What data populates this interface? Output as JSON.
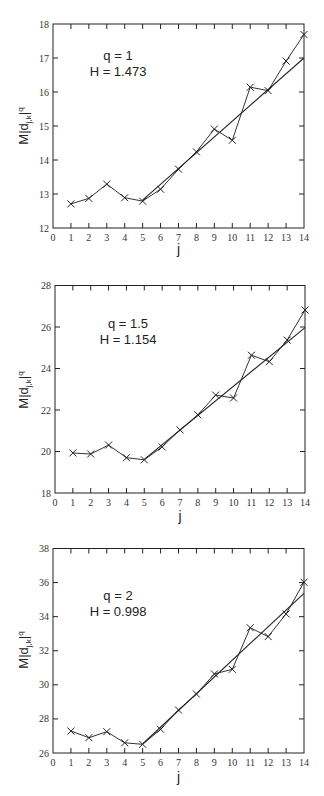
{
  "chart_data": [
    {
      "type": "line",
      "title": "",
      "annotation": [
        "q = 1",
        "H = 1.473"
      ],
      "xlabel": "j",
      "ylabel": "M|d_{j,k}|^q",
      "ylabel_parts": {
        "main": "M|d",
        "sub": "j,k",
        "tail": "|",
        "sup": "q"
      },
      "xlim": [
        0,
        14
      ],
      "ylim": [
        12,
        18
      ],
      "xticks": [
        "0",
        "1",
        "2",
        "3",
        "4",
        "5",
        "6",
        "7",
        "8",
        "9",
        "10",
        "11",
        "12",
        "13",
        "14"
      ],
      "yticks": [
        "12",
        "13",
        "14",
        "15",
        "16",
        "17",
        "18"
      ],
      "grid": false,
      "series": [
        {
          "name": "data",
          "marker": "x",
          "x": [
            1,
            2,
            3,
            4,
            5,
            6,
            7,
            8,
            9,
            10,
            11,
            12,
            13,
            14
          ],
          "y": [
            12.71,
            12.87,
            13.29,
            12.89,
            12.79,
            13.14,
            13.73,
            14.24,
            14.91,
            14.58,
            16.14,
            16.04,
            16.91,
            17.69
          ]
        },
        {
          "name": "fit",
          "marker": "none",
          "x": [
            5,
            14
          ],
          "y": [
            12.82,
            17.0
          ]
        }
      ]
    },
    {
      "type": "line",
      "title": "",
      "annotation": [
        "q = 1.5",
        "H = 1.154"
      ],
      "xlabel": "j",
      "ylabel": "M|d_{j,k}|^q",
      "ylabel_parts": {
        "main": "M|d",
        "sub": "j,k",
        "tail": "|",
        "sup": "q"
      },
      "xlim": [
        0,
        14
      ],
      "ylim": [
        18,
        28
      ],
      "xticks": [
        "0",
        "1",
        "2",
        "3",
        "4",
        "5",
        "6",
        "7",
        "8",
        "9",
        "10",
        "11",
        "12",
        "13",
        "14"
      ],
      "yticks": [
        "18",
        "20",
        "22",
        "24",
        "26",
        "28"
      ],
      "grid": false,
      "series": [
        {
          "name": "data",
          "marker": "x",
          "x": [
            1,
            2,
            3,
            4,
            5,
            6,
            7,
            8,
            9,
            10,
            11,
            12,
            13,
            14
          ],
          "y": [
            19.93,
            19.88,
            20.31,
            19.7,
            19.6,
            20.22,
            21.04,
            21.77,
            22.72,
            22.58,
            24.64,
            24.33,
            25.37,
            26.82
          ]
        },
        {
          "name": "fit",
          "marker": "none",
          "x": [
            5,
            14
          ],
          "y": [
            19.62,
            25.97
          ]
        }
      ]
    },
    {
      "type": "line",
      "title": "",
      "annotation": [
        "q = 2",
        "H = 0.998"
      ],
      "xlabel": "j",
      "ylabel": "M|d_{j,k}|^q",
      "ylabel_parts": {
        "main": "M|d",
        "sub": "j,k",
        "tail": "|",
        "sup": "q"
      },
      "xlim": [
        0,
        14
      ],
      "ylim": [
        26,
        38
      ],
      "xticks": [
        "0",
        "1",
        "2",
        "3",
        "4",
        "5",
        "6",
        "7",
        "8",
        "9",
        "10",
        "11",
        "12",
        "13",
        "14"
      ],
      "yticks": [
        "26",
        "28",
        "30",
        "32",
        "34",
        "36",
        "38"
      ],
      "grid": false,
      "series": [
        {
          "name": "data",
          "marker": "x",
          "x": [
            1,
            2,
            3,
            4,
            5,
            6,
            7,
            8,
            9,
            10,
            11,
            12,
            13,
            14
          ],
          "y": [
            27.29,
            26.9,
            27.25,
            26.6,
            26.51,
            27.39,
            28.52,
            29.46,
            30.64,
            30.91,
            33.35,
            32.83,
            34.16,
            36.02
          ]
        },
        {
          "name": "fit",
          "marker": "none",
          "x": [
            5,
            14
          ],
          "y": [
            26.53,
            35.37
          ]
        }
      ]
    }
  ]
}
